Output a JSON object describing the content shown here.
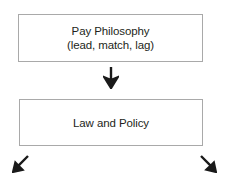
{
  "diagram": {
    "background_color": "#ffffff",
    "border_color": "#a9a9a9",
    "text_color": "#231f20",
    "arrow_color": "#1a1a1a",
    "nodes": [
      {
        "id": "pay-philosophy",
        "lines": [
          "Pay Philosophy",
          "(lead, match, lag)"
        ],
        "line1": "Pay Philosophy",
        "line2": "(lead, match, lag)"
      },
      {
        "id": "law-and-policy",
        "lines": [
          "Law and Policy"
        ],
        "line1": "Law and Policy"
      }
    ],
    "connectors": [
      {
        "id": "down-connector",
        "icon": "arrow-down-icon",
        "glyph": "↓",
        "direction": "down"
      },
      {
        "id": "down-left-connector",
        "icon": "arrow-down-left-icon",
        "glyph": "↙",
        "direction": "down-left"
      },
      {
        "id": "down-right-connector",
        "icon": "arrow-down-right-icon",
        "glyph": "↘",
        "direction": "down-right"
      }
    ]
  }
}
